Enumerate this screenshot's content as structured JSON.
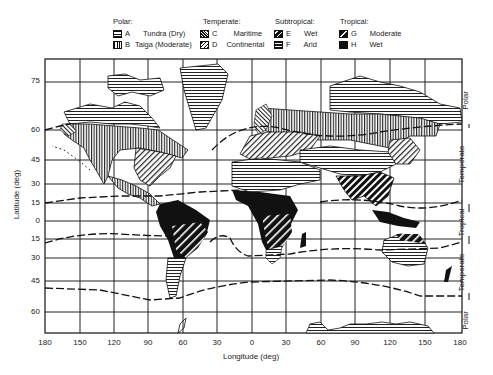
{
  "legend": {
    "groups": [
      {
        "title": "Polar:",
        "items": [
          {
            "code": "A",
            "label": "Tundra (Dry)",
            "pattern": "horizontal-lines"
          },
          {
            "code": "B",
            "label": "Taiga (Moderate)",
            "pattern": "vertical-lines"
          }
        ]
      },
      {
        "title": "Temperate:",
        "items": [
          {
            "code": "C",
            "label": "Maritime",
            "pattern": "cross-hatch"
          },
          {
            "code": "D",
            "label": "Continental",
            "pattern": "diagonal-hatch"
          }
        ]
      },
      {
        "title": "Subtropical:",
        "items": [
          {
            "code": "E",
            "label": "Wet",
            "pattern": "bold-diagonal"
          },
          {
            "code": "F",
            "label": "Arid",
            "pattern": "dense-horizontal"
          }
        ]
      },
      {
        "title": "Tropical:",
        "items": [
          {
            "code": "G",
            "label": "Moderate",
            "pattern": "white-diagonal-on-black"
          },
          {
            "code": "H",
            "label": "Wet",
            "pattern": "solid-black"
          }
        ]
      }
    ]
  },
  "axes": {
    "xlabel": "Longitude (deg)",
    "ylabel": "Latitude (deg)",
    "xticks": [
      "180",
      "150",
      "120",
      "90",
      "60",
      "30",
      "0",
      "30",
      "60",
      "90",
      "120",
      "150",
      "180"
    ],
    "yticks": [
      "75",
      "60",
      "45",
      "30",
      "15",
      "0",
      "15",
      "30",
      "45",
      "60"
    ]
  },
  "zones_right": [
    {
      "label": "Polar"
    },
    {
      "label": "Temperate"
    },
    {
      "label": "Tropical"
    },
    {
      "label": "Temperate"
    },
    {
      "label": "Polar"
    }
  ],
  "colors": {
    "ink": "#111111",
    "paper": "#ffffff"
  }
}
